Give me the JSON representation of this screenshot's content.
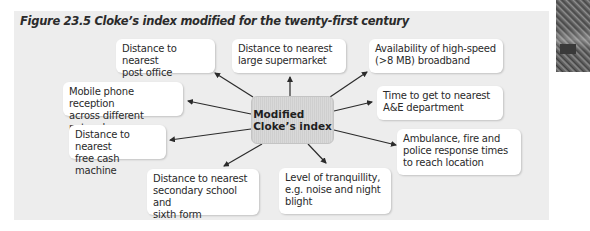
{
  "figure": {
    "title": "Figure 23.5  Cloke’s index modified for the twenty-first century"
  },
  "center": {
    "line1": "Modified",
    "line2": "Cloke’s index"
  },
  "nodes": [
    {
      "id": "post-office",
      "line1": "Distance to nearest",
      "line2": "post office",
      "line3": ""
    },
    {
      "id": "supermarket",
      "line1": "Distance to nearest",
      "line2": "large supermarket",
      "line3": ""
    },
    {
      "id": "broadband",
      "line1": "Availability of high-speed",
      "line2": "(>8 MB) broadband",
      "line3": ""
    },
    {
      "id": "mobile",
      "line1": "Mobile phone reception",
      "line2": "across different networks",
      "line3": ""
    },
    {
      "id": "ae",
      "line1": "Time to get to nearest",
      "line2": "A&E department",
      "line3": ""
    },
    {
      "id": "cash",
      "line1": "Distance to nearest",
      "line2": "free cash machine",
      "line3": ""
    },
    {
      "id": "emergency",
      "line1": "Ambulance, fire and",
      "line2": "police response times",
      "line3": "to reach location"
    },
    {
      "id": "school",
      "line1": "Distance to nearest",
      "line2": "secondary school and",
      "line3": "sixth form"
    },
    {
      "id": "tranquillity",
      "line1": "Level of tranquillity,",
      "line2": "e.g. noise and night",
      "line3": "blight"
    }
  ],
  "colors": {
    "panel": "#ededed",
    "box": "#ffffff",
    "arrow": "#2b2b2b",
    "center": "#d4d4d4"
  }
}
